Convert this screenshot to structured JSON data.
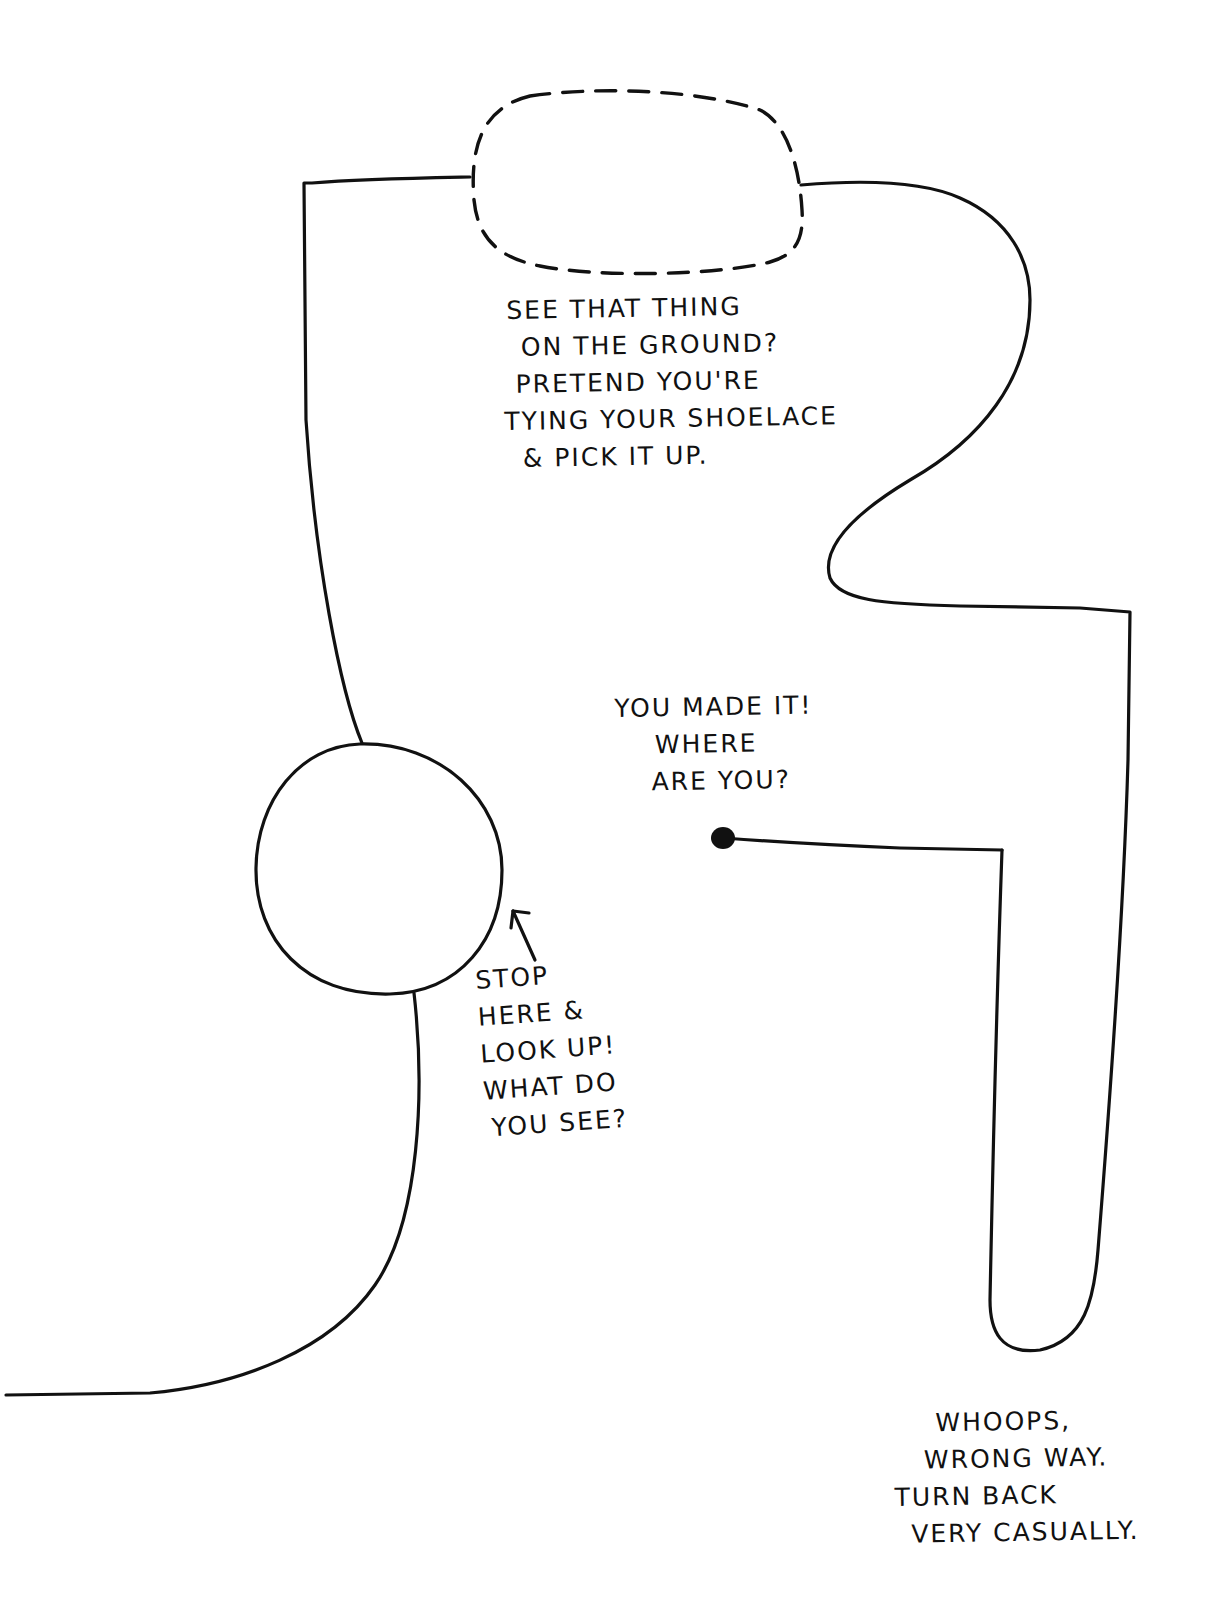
{
  "page": {
    "background": "#ffffff",
    "ink_color": "#111111"
  },
  "notes": {
    "ground_thing": {
      "lines": [
        "See that thing",
        "on the ground?",
        "Pretend you're",
        "tying your shoelace",
        "& pick it up."
      ]
    },
    "destination": {
      "lines": [
        "You made it!",
        "Where",
        "are you?"
      ]
    },
    "stop_here": {
      "lines": [
        "Stop",
        "here &",
        "look up!",
        "What do",
        "you see?"
      ]
    },
    "wrong_way": {
      "lines": [
        "Whoops,",
        "wrong way.",
        "Turn back",
        "very casually."
      ]
    }
  },
  "icons": {
    "arrow": "arrow-up-left-icon",
    "end_dot": "end-point-dot-icon"
  }
}
